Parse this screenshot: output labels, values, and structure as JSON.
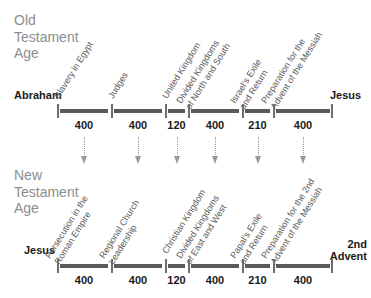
{
  "old_testament": {
    "age_title": "Old\nTestament\nAge",
    "start_label": "Abraham",
    "end_label": "Jesus",
    "eras": [
      {
        "name": "Slavery in Egypt",
        "duration": "400"
      },
      {
        "name": "Judges",
        "duration": "400"
      },
      {
        "name": "United Kingdom",
        "duration": "120"
      },
      {
        "name": "Divided Kingdoms\nof North and South",
        "duration": "400"
      },
      {
        "name": "Israel's Exile\nand Return",
        "duration": "210"
      },
      {
        "name": "Preparation for the\nAdvent of the Messiah",
        "duration": "400"
      }
    ]
  },
  "new_testament": {
    "age_title": "New\nTestament\nAge",
    "start_label": "Jesus",
    "end_label": "2nd\nAdvent",
    "eras": [
      {
        "name": "Persecution in the\nRoman Empire",
        "duration": "400"
      },
      {
        "name": "Regional Church\nLeadership",
        "duration": "400"
      },
      {
        "name": "Christian Kingdom",
        "duration": "120"
      },
      {
        "name": "Divided Kingdoms\nof East and West",
        "duration": "400"
      },
      {
        "name": "Papal's Exile\nand Return",
        "duration": "210"
      },
      {
        "name": "Preparation for the 2nd\nAdvent of the Messiah",
        "duration": "400"
      }
    ]
  },
  "connectors": {
    "count": 6,
    "direction": "down",
    "style": "dotted-arrow"
  },
  "colors": {
    "title_gray": "#8d8d8d",
    "label_gray": "#5c5c5c",
    "axis_gray": "#5a5a5a",
    "tick_gray": "#6e6e6e",
    "text_black": "#1a1a1a",
    "arrow_gray": "#9a9a9a",
    "background": "#ffffff"
  }
}
